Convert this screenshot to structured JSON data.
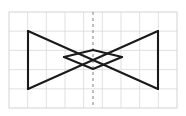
{
  "canvas": {
    "width": 186,
    "height": 116,
    "background_color": "#ffffff"
  },
  "grid": {
    "name": "square-grid",
    "x": 9,
    "y": 12,
    "width": 168,
    "height": 96,
    "columns": 9,
    "rows": 5,
    "cell_width": 18.67,
    "cell_height": 19.2,
    "line_color": "#d9d9d9",
    "border_color": "#cfcfcf",
    "line_width": 0.8
  },
  "symmetry_line": {
    "name": "vertical-symmetry-axis",
    "orientation": "vertical",
    "x": 93,
    "y1": 12,
    "y2": 108,
    "color": "#8c8c8c",
    "dash": "3 3",
    "line_width": 1.1
  },
  "shape": {
    "name": "bowtie-figure",
    "stroke_color": "#1a1a1a",
    "stroke_width": 2.1,
    "fill": "none",
    "outer_bowtie": {
      "description": "Large bowtie: two triangles meeting at the center point",
      "left_triangle": [
        [
          28,
          31
        ],
        [
          28,
          89
        ],
        [
          93,
          60
        ]
      ],
      "right_triangle": [
        [
          158,
          31
        ],
        [
          158,
          89
        ],
        [
          93,
          60
        ]
      ],
      "left_edge": {
        "x": 28,
        "y1": 31,
        "y2": 89
      },
      "right_edge": {
        "x": 158,
        "y1": 31,
        "y2": 89
      }
    },
    "inner_bowtie": {
      "description": "Small inner bowtie with horizontal apex points left and right of centre",
      "left_vertex": [
        64,
        57
      ],
      "right_vertex": [
        122,
        57
      ],
      "center_point": [
        93,
        60
      ]
    },
    "crossing_points": [
      [
        93,
        50
      ],
      [
        93,
        69
      ]
    ]
  },
  "polylines": [
    {
      "name": "outer-left-vertical",
      "points": "28,31 28,89"
    },
    {
      "name": "outer-right-vertical",
      "points": "158,31 158,89"
    },
    {
      "name": "outer-top-left-to-center-right",
      "points": "28,31 158,89"
    },
    {
      "name": "outer-top-right-to-center-left",
      "points": "158,31 28,89"
    },
    {
      "name": "inner-upper-chevron",
      "points": "64,57 93,50 122,57"
    },
    {
      "name": "inner-lower-chevron",
      "points": "64,57 93,69 122,57"
    }
  ]
}
